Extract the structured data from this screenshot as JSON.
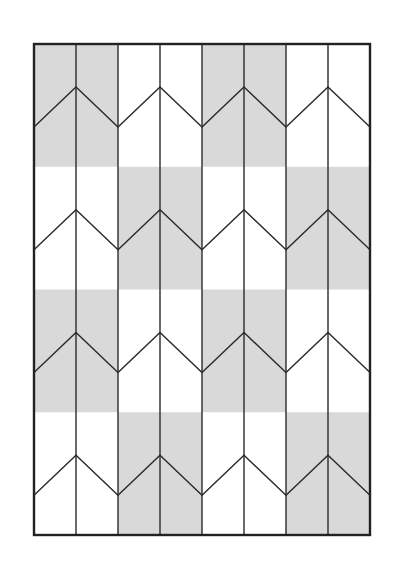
{
  "diagram": {
    "title": "",
    "type": "chevron-tessellation-pattern",
    "frame": {
      "x": 34,
      "y": 44,
      "width": 336,
      "height": 491
    },
    "columns": 8,
    "column_pairs": 4,
    "bands": 4,
    "colors": {
      "background": "#ffffff",
      "shade": "#d9d9d9",
      "line": "#2a2a2a",
      "border": "#222222"
    },
    "chevron": {
      "peak_offset": 43,
      "valley_offset": 83
    },
    "shading": [
      [
        true,
        false,
        true,
        false
      ],
      [
        false,
        true,
        false,
        true
      ],
      [
        true,
        false,
        true,
        false
      ],
      [
        false,
        true,
        false,
        true
      ]
    ]
  }
}
